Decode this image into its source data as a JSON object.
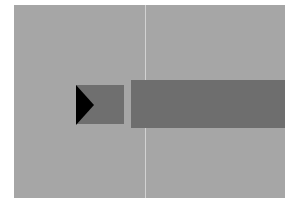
{
  "scene": {
    "background_color": "#a6a6a6",
    "divider_color": "#d2d2d2",
    "block_color": "#6f6f6f",
    "bar_color": "#6e6e6e",
    "pointer_color": "#000000",
    "pointer_icon": "triangle-right-icon"
  }
}
